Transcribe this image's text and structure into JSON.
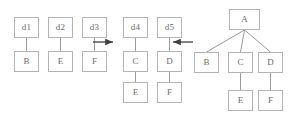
{
  "diagram": {
    "type": "tree-transformation-diagram",
    "canvas": {
      "width": 289,
      "height": 121
    },
    "style": {
      "box_fill": "#ffffff",
      "box_border": "#b4b4b4",
      "text_color": "#6b6b6b",
      "edge_color": "#9a9a9a",
      "arrow_color": "#4a4a4a",
      "background": "#ffffff"
    },
    "groups": [
      {
        "id": "left-forest",
        "nodes": [
          {
            "id": "d1",
            "label": "d1",
            "x": 14,
            "y": 17,
            "w": 25,
            "h": 21
          },
          {
            "id": "b1",
            "label": "B",
            "x": 14,
            "y": 51,
            "w": 25,
            "h": 21
          },
          {
            "id": "d2",
            "label": "d2",
            "x": 48,
            "y": 17,
            "w": 25,
            "h": 21
          },
          {
            "id": "e1",
            "label": "E",
            "x": 48,
            "y": 51,
            "w": 25,
            "h": 21
          },
          {
            "id": "d3",
            "label": "d3",
            "x": 82,
            "y": 17,
            "w": 25,
            "h": 21
          },
          {
            "id": "f1",
            "label": "F",
            "x": 82,
            "y": 51,
            "w": 25,
            "h": 21
          }
        ],
        "edges": [
          {
            "from": "d1",
            "to": "b1"
          },
          {
            "from": "d2",
            "to": "e1"
          },
          {
            "from": "d3",
            "to": "f1"
          }
        ]
      },
      {
        "id": "middle-forest",
        "nodes": [
          {
            "id": "d4",
            "label": "d4",
            "x": 123,
            "y": 17,
            "w": 25,
            "h": 21
          },
          {
            "id": "c2",
            "label": "C",
            "x": 123,
            "y": 51,
            "w": 25,
            "h": 21
          },
          {
            "id": "e2",
            "label": "E",
            "x": 123,
            "y": 82,
            "w": 25,
            "h": 21
          },
          {
            "id": "d5",
            "label": "d5",
            "x": 157,
            "y": 17,
            "w": 25,
            "h": 21
          },
          {
            "id": "d6",
            "label": "D",
            "x": 157,
            "y": 51,
            "w": 25,
            "h": 21
          },
          {
            "id": "f2",
            "label": "F",
            "x": 157,
            "y": 82,
            "w": 25,
            "h": 21
          }
        ],
        "edges": [
          {
            "from": "d4",
            "to": "c2"
          },
          {
            "from": "c2",
            "to": "e2"
          },
          {
            "from": "d5",
            "to": "d6"
          },
          {
            "from": "d6",
            "to": "f2"
          }
        ]
      },
      {
        "id": "right-tree",
        "nodes": [
          {
            "id": "a",
            "label": "A",
            "x": 229,
            "y": 9,
            "w": 31,
            "h": 21
          },
          {
            "id": "b3",
            "label": "B",
            "x": 194,
            "y": 52,
            "w": 25,
            "h": 21
          },
          {
            "id": "c3",
            "label": "C",
            "x": 228,
            "y": 52,
            "w": 25,
            "h": 21
          },
          {
            "id": "d3r",
            "label": "D",
            "x": 258,
            "y": 52,
            "w": 25,
            "h": 21
          },
          {
            "id": "e3",
            "label": "E",
            "x": 228,
            "y": 90,
            "w": 25,
            "h": 21
          },
          {
            "id": "f3",
            "label": "F",
            "x": 258,
            "y": 90,
            "w": 25,
            "h": 21
          }
        ],
        "edges": [
          {
            "from": "a",
            "to": "b3"
          },
          {
            "from": "a",
            "to": "c3"
          },
          {
            "from": "a",
            "to": "d3r"
          },
          {
            "from": "c3",
            "to": "e3"
          },
          {
            "from": "d3r",
            "to": "f3"
          }
        ]
      }
    ],
    "arrows": [
      {
        "id": "arrow-left-to-middle",
        "direction": "right",
        "x1": 93,
        "y1": 42,
        "x2": 115,
        "y2": 42
      },
      {
        "id": "arrow-right-to-middle",
        "direction": "left",
        "x1": 193,
        "y1": 42,
        "x2": 171,
        "y2": 42
      }
    ]
  }
}
